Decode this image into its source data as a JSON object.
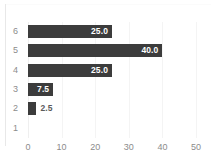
{
  "chart_data": {
    "type": "bar",
    "orientation": "horizontal",
    "title": "",
    "xlabel": "",
    "ylabel": "",
    "categories": [
      "6",
      "5",
      "4",
      "3",
      "2",
      "1"
    ],
    "values": [
      25.0,
      40.0,
      25.0,
      7.5,
      2.5,
      null
    ],
    "data_labels": [
      "25.0",
      "40.0",
      "25.0",
      "7.5",
      "2.5",
      ""
    ],
    "label_positions": [
      "inside",
      "inside",
      "inside",
      "inside",
      "outside",
      "none"
    ],
    "xlim": [
      0,
      50
    ],
    "xticks": [
      0,
      10,
      20,
      30,
      40,
      50
    ],
    "xtick_labels": [
      "0",
      "10",
      "20",
      "30",
      "40",
      "50"
    ],
    "grid": true,
    "grid_axis": "x",
    "legend": false,
    "legend_position": "none",
    "series": [
      {
        "name": "",
        "values": [
          25.0,
          40.0,
          25.0,
          7.5,
          2.5,
          null
        ]
      }
    ],
    "colors": {
      "bar": "#3c3c3c",
      "label_inside": "#ffffff",
      "label_outside": "#5a5a5a",
      "tick_text": "#8c8c8c",
      "gridline": "#f4f4f4",
      "background": "#ffffff",
      "frame": "#e8e8e8"
    }
  }
}
